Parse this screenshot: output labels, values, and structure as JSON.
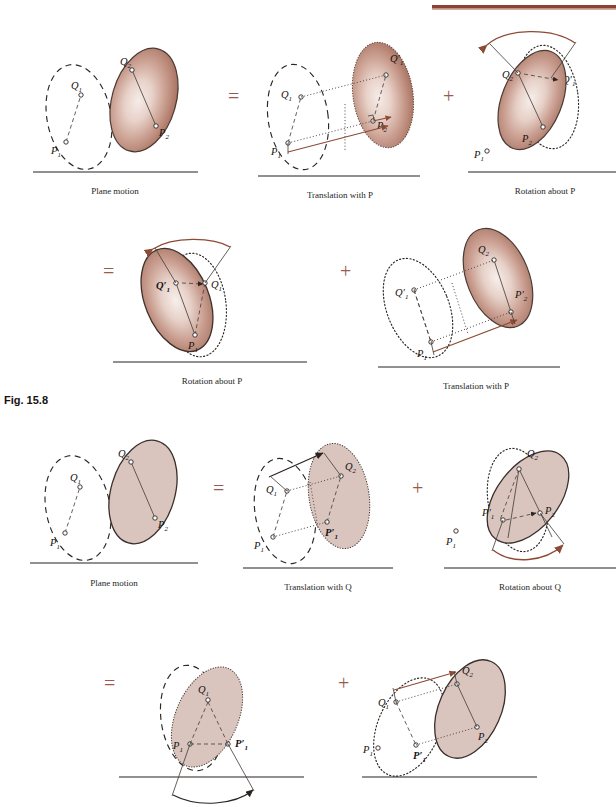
{
  "figure": {
    "number_label": "Fig. 15.8",
    "topbar_color": "#8b4330",
    "operator_color": "#9b5b4c",
    "body_fill_shaded": "#c09489",
    "body_fill_flat": "#d8c3bd",
    "ground_color": "#6e6b68",
    "arrow_color": "#8d4a35"
  },
  "rows": [
    {
      "id": "row-1",
      "panels": [
        {
          "id": "panel-plane-motion-p",
          "caption": "Plane motion",
          "points": [
            "Q_1",
            "P_1",
            "Q_2",
            "P_2"
          ]
        },
        {
          "id": "panel-translation-p",
          "caption": "Translation with  P",
          "operator": "=",
          "points": [
            "Q_1",
            "P_1",
            "Q'_1",
            "P_2"
          ]
        },
        {
          "id": "panel-rotation-p",
          "caption": "Rotation about  P",
          "operator": "+",
          "points": [
            "Q_2",
            "Q'_1",
            "P_2",
            "P_1"
          ]
        }
      ]
    },
    {
      "id": "row-2",
      "panels": [
        {
          "id": "panel-rotation-p-2",
          "caption": "Rotation about  P",
          "operator": "=",
          "points": [
            "Q'_1",
            "Q_1",
            "P_1"
          ]
        },
        {
          "id": "panel-translation-p-2",
          "caption": "Translation with  P",
          "operator": "+",
          "points": [
            "Q'_1",
            "P_1",
            "Q_2",
            "P_2"
          ]
        }
      ]
    },
    {
      "id": "row-3",
      "panels": [
        {
          "id": "panel-plane-motion-q",
          "caption": "Plane motion",
          "points": [
            "Q_1",
            "P_1",
            "Q_2",
            "P_2"
          ]
        },
        {
          "id": "panel-translation-q",
          "caption": "Translation with Q",
          "operator": "=",
          "points": [
            "Q_1",
            "P_1",
            "Q_2",
            "P'_1"
          ]
        },
        {
          "id": "panel-rotation-q",
          "caption": "Rotation about Q",
          "operator": "+",
          "points": [
            "Q_2",
            "P'_1",
            "P_2",
            "P_1"
          ]
        }
      ]
    },
    {
      "id": "row-4",
      "panels": [
        {
          "id": "panel-rotation-q-2",
          "operator": "=",
          "points": [
            "Q_1",
            "P_1",
            "P'_1"
          ]
        },
        {
          "id": "panel-translation-q-2",
          "operator": "+",
          "points": [
            "Q_1",
            "P_1",
            "P'_1",
            "Q_2",
            "P_2"
          ]
        }
      ]
    }
  ],
  "labels": {
    "Q1": "Q",
    "Q1s": "1",
    "Q2": "Q",
    "Q2s": "2",
    "Q1p": "Q′",
    "Q1ps": "1",
    "P1": "P",
    "P1s": "1",
    "P2": "P",
    "P2s": "2",
    "P1p": "P′",
    "P1ps": "1",
    "P2p": "P′",
    "P2ps": "2",
    "eq": "=",
    "plus": "+"
  },
  "captions": {
    "plane_motion": "Plane motion",
    "translation_p": "Translation with  P",
    "rotation_p": "Rotation about  P",
    "translation_q": "Translation with Q",
    "rotation_q": "Rotation about Q"
  }
}
